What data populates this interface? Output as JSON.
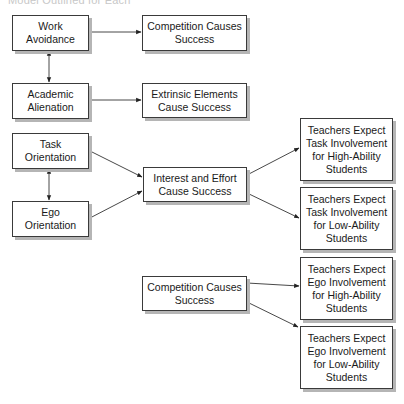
{
  "caption": "Model Outlined for Each",
  "nodes": {
    "work_avoidance": "Work\nAvoidance",
    "competition_top": "Competition Causes\nSuccess",
    "academic_alienation": "Academic\nAlienation",
    "extrinsic_elements": "Extrinsic Elements\nCause Success",
    "task_orientation": "Task\nOrientation",
    "ego_orientation": "Ego\nOrientation",
    "interest_effort": "Interest and Effort\nCause Success",
    "teachers_task_high": "Teachers Expect\nTask Involvement\nfor High-Ability\nStudents",
    "teachers_task_low": "Teachers Expect\nTask Involvement\nfor Low-Ability\nStudents",
    "competition_bottom": "Competition Causes\nSuccess",
    "teachers_ego_high": "Teachers Expect\nEgo Involvement\nfor High-Ability\nStudents",
    "teachers_ego_low": "Teachers Expect\nEgo Involvement\nfor Low-Ability\nStudents"
  },
  "edges": [
    {
      "from": "Work Avoidance",
      "to": "Competition Causes Success",
      "type": "directed"
    },
    {
      "from": "Work Avoidance",
      "to": "Academic Alienation",
      "type": "bidirectional"
    },
    {
      "from": "Academic Alienation",
      "to": "Extrinsic Elements Cause Success",
      "type": "directed"
    },
    {
      "from": "Task Orientation",
      "to": "Ego Orientation",
      "type": "bidirectional"
    },
    {
      "from": "Task Orientation",
      "to": "Interest and Effort Cause Success",
      "type": "directed"
    },
    {
      "from": "Ego Orientation",
      "to": "Interest and Effort Cause Success",
      "type": "directed"
    },
    {
      "from": "Interest and Effort Cause Success",
      "to": "Teachers Expect Task Involvement for High-Ability Students",
      "type": "directed"
    },
    {
      "from": "Interest and Effort Cause Success",
      "to": "Teachers Expect Task Involvement for Low-Ability Students",
      "type": "directed"
    },
    {
      "from": "Competition Causes Success",
      "to": "Teachers Expect Ego Involvement for High-Ability Students",
      "type": "directed"
    },
    {
      "from": "Competition Causes Success",
      "to": "Teachers Expect Ego Involvement for Low-Ability Students",
      "type": "directed"
    }
  ]
}
